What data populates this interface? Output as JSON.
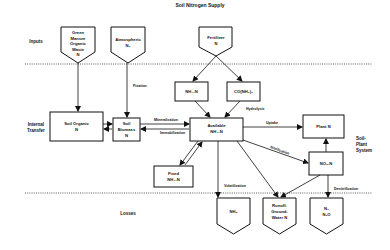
{
  "title": "Soil Nitrogen Supply",
  "sections": {
    "inputs": "Inputs",
    "internal_transfer": [
      "Internal",
      "Transfer"
    ],
    "losses": "Losses",
    "soil_plant_system": [
      "Soil-",
      "Plant",
      "System"
    ]
  },
  "nodes": {
    "green_manure": [
      "Green",
      "Manure",
      "Organic",
      "Waste",
      "N"
    ],
    "atmospheric": [
      "Atmospheric",
      "N₂"
    ],
    "fertilizer": [
      "Fertilizer",
      "N"
    ],
    "nh4": "NH₄-N",
    "urea": "CO(NH₂)₂",
    "soil_organic": [
      "Soil Organic",
      "N"
    ],
    "soil_biomass": [
      "Soil",
      "Biomass",
      "N"
    ],
    "available": [
      "Available",
      "NH₄-N"
    ],
    "plant": "Plant N",
    "no3": "NO₃-N",
    "fixed": [
      "Fixed",
      "NH₄-N"
    ],
    "nh3": "NH₃",
    "runoff": [
      "Runoff-",
      "Ground-",
      "Water N"
    ],
    "n2": [
      "N₂",
      "N₂O"
    ]
  },
  "edges": {
    "fixation": "Fixation",
    "hydrolysis": "Hydrolysis",
    "mineralization": "Mineralization",
    "immobilization": "Immobilization",
    "uptake": "Uptake",
    "nitrification": "Nitrification",
    "volatilization": "Volatilization",
    "denitrification": "Denitrification"
  }
}
